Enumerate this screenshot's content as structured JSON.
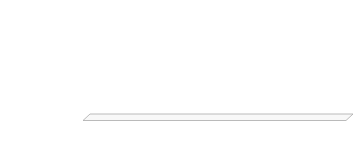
{
  "chart_data": {
    "type": "bar",
    "orientation": "horizontal",
    "title": "",
    "categories": [
      "ich weiß nicht",
      "sehr schwer",
      "etwas schwer",
      "etwas einfach",
      "sehr einfach"
    ],
    "values": [
      16,
      35,
      38,
      12,
      4
    ],
    "xlabel": "%",
    "ylabel": "",
    "xlim": [
      0,
      40
    ],
    "xticks": [
      0,
      5,
      10,
      15,
      20,
      25,
      30,
      35,
      40
    ],
    "grid": true,
    "legend": "none",
    "bar_color": "#1d1d1d",
    "gridline_color": "#e4e4e4",
    "axis_text_color": "#4d4d4d",
    "category_text_color": "#1f1f1f",
    "floor_fill_color": "#f8f8f8",
    "floor_border_color": "#a9a9a9",
    "background_color": "#ffffff"
  }
}
